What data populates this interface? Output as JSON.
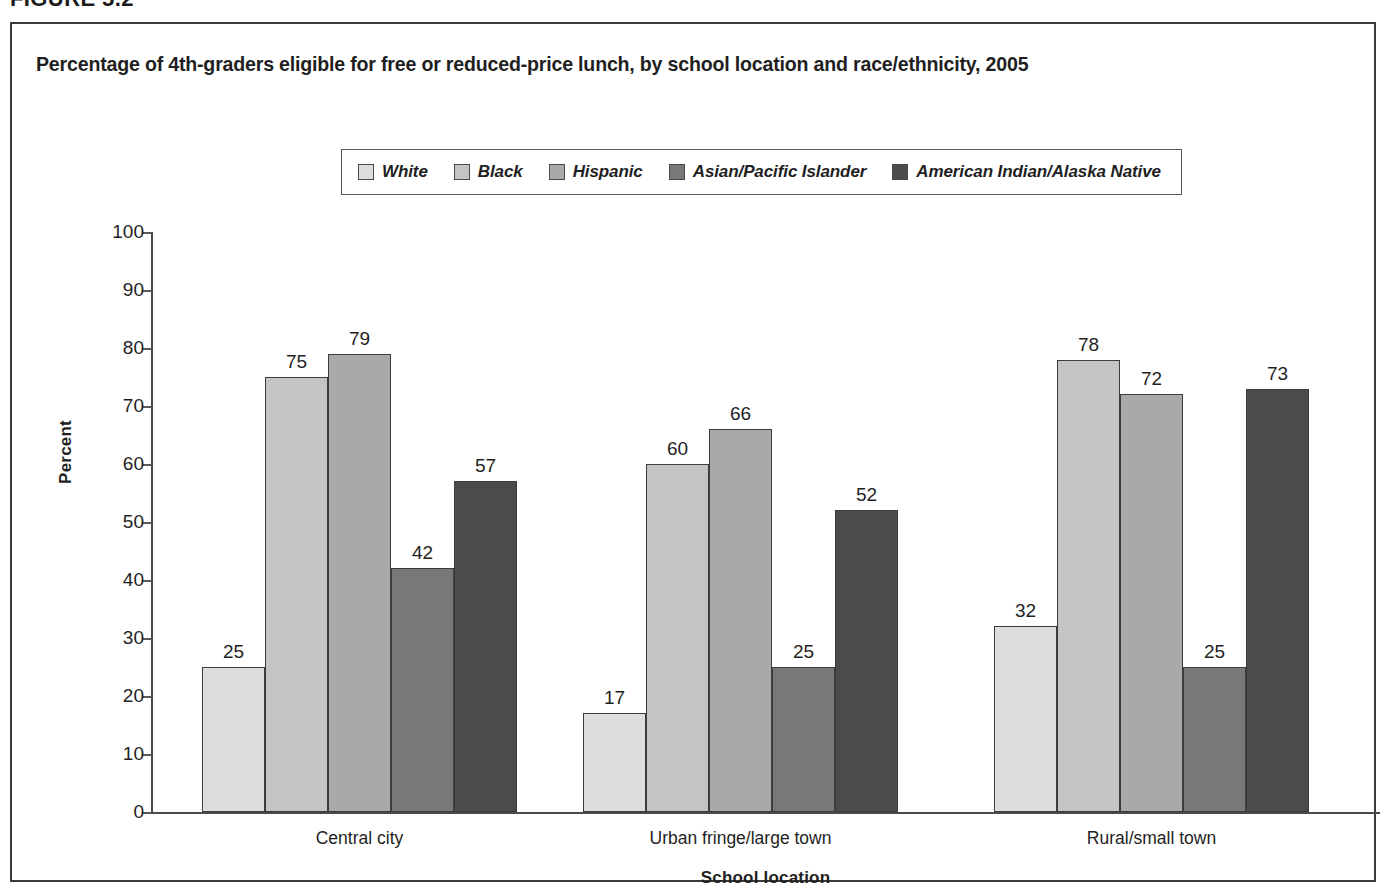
{
  "figure": {
    "number": "FIGURE 5.2"
  },
  "chart_data": {
    "type": "bar",
    "title": "Percentage of 4th-graders eligible for free or reduced-price lunch, by school location and race/ethnicity, 2005",
    "xlabel": "School location",
    "ylabel": "Percent",
    "ylim": [
      0,
      100
    ],
    "ytick_step": 10,
    "ytick_labels": [
      "100",
      "90",
      "80",
      "70",
      "60",
      "50",
      "40",
      "30",
      "20",
      "10",
      "0"
    ],
    "grid": false,
    "legend_position": "top-center",
    "categories": [
      "Central city",
      "Urban fringe/large town",
      "Rural/small town"
    ],
    "series": [
      {
        "name": "White",
        "color": "#dddddd",
        "values": [
          25,
          17,
          32
        ]
      },
      {
        "name": "Black",
        "color": "#c4c4c4",
        "values": [
          75,
          60,
          78
        ]
      },
      {
        "name": "Hispanic",
        "color": "#a9a9a9",
        "values": [
          79,
          66,
          72
        ]
      },
      {
        "name": "Asian/Pacific Islander",
        "color": "#787878",
        "values": [
          42,
          25,
          25
        ]
      },
      {
        "name": "American Indian/Alaska Native",
        "color": "#4b4b4b",
        "values": [
          57,
          52,
          73
        ]
      }
    ]
  }
}
